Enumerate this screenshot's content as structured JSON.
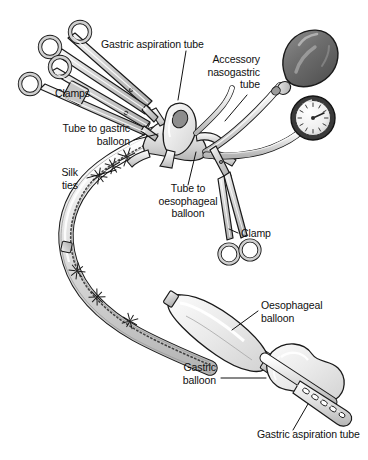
{
  "figure": {
    "background_color": "#ffffff",
    "ink_color": "#1a1a1a",
    "tube_fill": "#e9e9e9",
    "tube_shade": "#c3c3c3",
    "balloon_fill": "#efefef",
    "bulb_fill": "#6e6e6e",
    "metal_fill": "#d2d2d2",
    "gauge_ring": "#3a3a3a",
    "gauge_face": "#f2f2f2"
  },
  "labels": {
    "gastric_aspiration_tube_top": "Gastric aspiration tube",
    "accessory_nasogastric_tube": "Accessory\nnasogastric\ntube",
    "clamps": "Clamps",
    "tube_to_gastric_balloon": "Tube to gastric\nballoon",
    "silk_ties": "Silk\nties",
    "tube_to_oesophageal_balloon": "Tube to\noesophageal\nballoon",
    "clamp": "Clamp",
    "oesophageal_balloon": "Oesophageal\nballoon",
    "gastric_balloon": "Gastric\nballoon",
    "gastric_aspiration_tube_bottom": "Gastric aspiration tube"
  },
  "parts": {
    "clamp_upper": "surgical-clamp-upper",
    "clamp_lower": "surgical-clamp-lower",
    "clamp_right": "surgical-clamp-right",
    "inflation_bulb": "rubber-inflation-bulb",
    "pressure_gauge": "pressure-gauge-dial",
    "manifold": "tube-manifold-hub",
    "funnel": "gastric-aspiration-funnel",
    "main_shaft": "main-tube-shaft",
    "oesophageal_balloon": "oesophageal-balloon",
    "gastric_balloon": "gastric-balloon",
    "distal_tip": "distal-tip-with-eyelets",
    "silk_tie_knots": "silk-tie-knots"
  }
}
